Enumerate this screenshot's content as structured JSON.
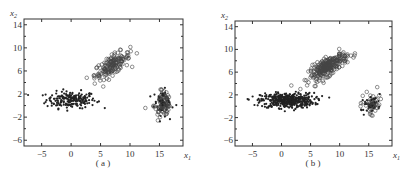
{
  "chart_data": [
    {
      "type": "scatter",
      "panel_label": "(a)",
      "xlabel": "x1",
      "ylabel": "x2",
      "xlim": [
        -8,
        19
      ],
      "ylim": [
        -7,
        15
      ],
      "xticks": [
        -5,
        0,
        5,
        10,
        15
      ],
      "yticks": [
        -6,
        -2,
        2,
        6,
        10,
        14
      ],
      "grid": false,
      "legend": "none",
      "series": [
        {
          "name": "cluster-dots",
          "marker": "filled-dot",
          "center": [
            0,
            1
          ],
          "spread": [
            3.5,
            1.2
          ],
          "count": 200
        },
        {
          "name": "cluster-diagonal-circles",
          "marker": "open-circle",
          "center": [
            7,
            7
          ],
          "spread": [
            2.5,
            1.4
          ],
          "count": 160
        },
        {
          "name": "cluster-right",
          "marker": "mixed",
          "center": [
            15.5,
            0.5
          ],
          "spread": [
            1.2,
            1.8
          ],
          "count": 140
        }
      ]
    },
    {
      "type": "scatter",
      "panel_label": "(b)",
      "xlabel": "x1",
      "ylabel": "x2",
      "xlim": [
        -8,
        19
      ],
      "ylim": [
        -7,
        15
      ],
      "xticks": [
        -5,
        0,
        5,
        10,
        15
      ],
      "yticks": [
        -6,
        -2,
        2,
        6,
        10,
        14
      ],
      "grid": false,
      "legend": "none",
      "series": [
        {
          "name": "cluster-dots",
          "marker": "filled-dot",
          "center": [
            1,
            1
          ],
          "spread": [
            3.8,
            1.1
          ],
          "count": 450
        },
        {
          "name": "cluster-diagonal-circles",
          "marker": "open-circle",
          "center": [
            8,
            7
          ],
          "spread": [
            2.8,
            1.3
          ],
          "count": 260
        },
        {
          "name": "cluster-right",
          "marker": "mixed",
          "center": [
            15.5,
            0.5
          ],
          "spread": [
            1.2,
            1.4
          ],
          "count": 90
        }
      ]
    }
  ],
  "captions": {
    "a": "(a)",
    "b": "(b)"
  },
  "axis_labels": {
    "x": "x",
    "x_sub": "1",
    "y": "x",
    "y_sub": "2"
  }
}
